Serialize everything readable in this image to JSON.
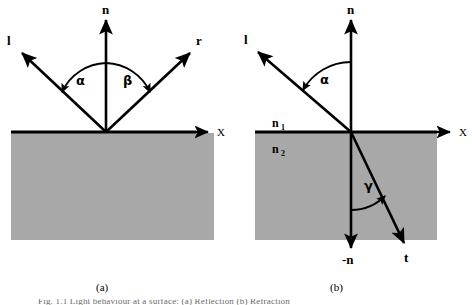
{
  "figure": {
    "background_color": "#ffffff",
    "medium_fill_color": "#a8a8a8",
    "stroke_color": "#000000",
    "panels": [
      {
        "id": "a",
        "label": "(a)",
        "title_semantics": "Reflection",
        "vectors": [
          {
            "name": "normal",
            "label": "n",
            "direction": "up"
          },
          {
            "name": "incident",
            "label": "l",
            "direction": "up-left"
          },
          {
            "name": "reflected",
            "label": "r",
            "direction": "up-right"
          }
        ],
        "axis": {
          "label": "X",
          "direction": "right"
        },
        "angles": [
          {
            "name": "alpha",
            "label": "α",
            "between": "l and n"
          },
          {
            "name": "beta",
            "label": "β",
            "between": "n and r"
          }
        ]
      },
      {
        "id": "b",
        "label": "(b)",
        "title_semantics": "Refraction",
        "vectors": [
          {
            "name": "normal",
            "label": "n",
            "direction": "up"
          },
          {
            "name": "incident",
            "label": "l",
            "direction": "up-left"
          },
          {
            "name": "negative-normal",
            "label": "-n",
            "direction": "down"
          },
          {
            "name": "transmitted",
            "label": "t",
            "direction": "down-right"
          }
        ],
        "axis": {
          "label": "X",
          "direction": "right"
        },
        "angles": [
          {
            "name": "alpha",
            "label": "α",
            "between": "l and n"
          },
          {
            "name": "gamma",
            "label": "γ",
            "between": "-n and t"
          }
        ],
        "media": [
          {
            "name": "upper-medium",
            "label": "n",
            "subscript": "1"
          },
          {
            "name": "lower-medium",
            "label": "n",
            "subscript": "2"
          }
        ]
      }
    ],
    "caption": "Fig. 1.1 Light behaviour at a surface: (a) Reflection (b) Refraction"
  }
}
